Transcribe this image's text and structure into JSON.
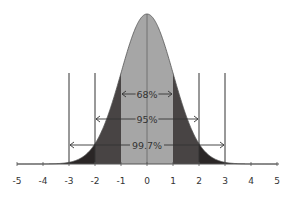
{
  "chart_data": {
    "type": "area",
    "title": "",
    "xlabel": "",
    "ylabel": "",
    "distribution": "standard normal",
    "mean": 0,
    "std_dev": 1,
    "xlim": [
      -5,
      5
    ],
    "x_ticks": [
      "-5",
      "-4",
      "-3",
      "-2",
      "-1",
      "0",
      "1",
      "2",
      "3",
      "4",
      "5"
    ],
    "grid": false,
    "regions": [
      {
        "range": [
          -1,
          1
        ],
        "label": "68%",
        "color": "#a6a6a6"
      },
      {
        "range": [
          -2,
          2
        ],
        "label": "95%",
        "color": "#444040"
      },
      {
        "range": [
          -3,
          3
        ],
        "label": "99.7%",
        "color": "#2a2626"
      }
    ],
    "vertical_lines_at": [
      -3,
      -2,
      2,
      3
    ]
  },
  "colors": {
    "center": "#a6a6a6",
    "middle": "#484444",
    "tail": "#2a2626",
    "line": "#333333"
  }
}
